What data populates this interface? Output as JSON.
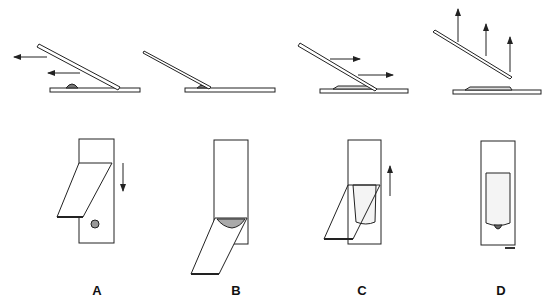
{
  "diagram": {
    "type": "step-sequence",
    "stroke_color": "#222222",
    "fill_color": "#ffffff",
    "steps": [
      {
        "label": "A",
        "side_motion": "spreader slide moves left toward drop",
        "top_motion": "spreader pulled down toward drop"
      },
      {
        "label": "B",
        "side_motion": "spreader contacts drop; drop spreads along edge",
        "top_motion": "drop spreads along spreader edge"
      },
      {
        "label": "C",
        "side_motion": "spreader pushed right to form smear",
        "top_motion": "spreader pushed up forming film"
      },
      {
        "label": "D",
        "side_motion": "spreader lifted away",
        "top_motion": "finished smear with feathered edge"
      }
    ],
    "labels": [
      "A",
      "B",
      "C",
      "D"
    ],
    "figure_code": "M04"
  }
}
